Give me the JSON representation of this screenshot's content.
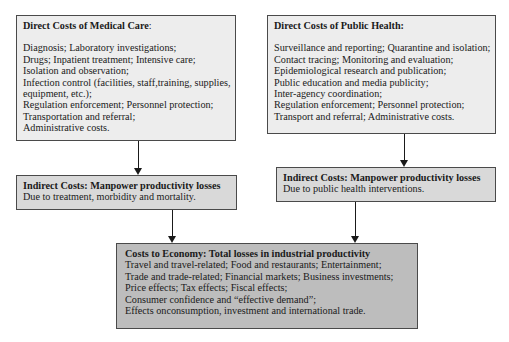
{
  "diagram": {
    "medical_care": {
      "title": "Direct Costs of Medical Care",
      "title_suffix": ":",
      "items": [
        "Diagnosis; Laboratory investigations;",
        "Drugs; Inpatient treatment; Intensive care;",
        "Isolation and observation;",
        "Infection control (facilities, staff,training, supplies,",
        "equipment, etc.);",
        "Regulation enforcement; Personnel protection;",
        "Transportation and referral;",
        "Administrative costs."
      ]
    },
    "public_health": {
      "title": "Direct Costs of Public Health:",
      "items": [
        "Surveillance and reporting; Quarantine and isolation;",
        "Contact tracing; Monitoring and evaluation;",
        "Epidemiological research and publication;",
        "Public education and media publicity;",
        "Inter-agency coordination;",
        "Regulation enforcement; Personnel protection;",
        "Transport and referral; Administrative costs."
      ]
    },
    "indirect_medical": {
      "title_prefix": "Indirect Costs",
      "title_rest": ": Manpower productivity losses",
      "description": "Due to treatment, morbidity and mortality."
    },
    "indirect_public": {
      "title": "Indirect Costs: Manpower productivity losses",
      "description": "Due to public health interventions."
    },
    "economy": {
      "title": "Costs to Economy: Total losses in industrial productivity",
      "items": [
        "Travel and travel-related; Food and restaurants; Entertainment;",
        "Trade and trade-related; Financial markets; Business investments;",
        "Price effects; Tax effects; Fiscal effects;",
        "Consumer confidence and “effective demand”;",
        "Effects onconsumption, investment and international trade."
      ]
    },
    "connections": [
      {
        "from": "medical_care",
        "to": "indirect_medical"
      },
      {
        "from": "public_health",
        "to": "indirect_public"
      },
      {
        "from": "indirect_medical",
        "to": "economy"
      },
      {
        "from": "indirect_public",
        "to": "economy"
      }
    ]
  }
}
